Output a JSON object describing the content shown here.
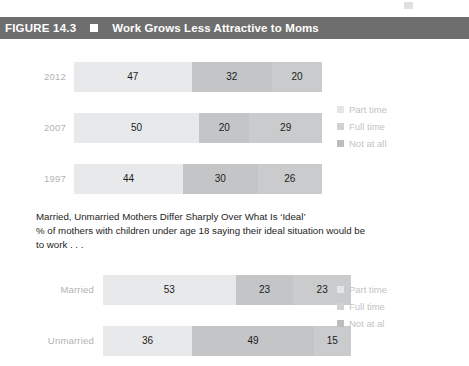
{
  "figure": {
    "number": "FIGURE 14.3",
    "bullet_icon": "square-bullet-icon",
    "title": "Work Grows Less Attractive to Moms"
  },
  "caption": {
    "headline": "Married, Unmarried Mothers Differ Sharply Over What Is ‘Ideal’",
    "subline": "% of mothers with children under age 18 saying their ideal situation would be to work . . ."
  },
  "legend_top": {
    "items": [
      {
        "label": "Part time",
        "swatch": "#e4e5e6"
      },
      {
        "label": "Full time",
        "swatch": "#cfd1d2"
      },
      {
        "label": "Not at all",
        "swatch": "#bbbdbe"
      }
    ]
  },
  "legend_bottom": {
    "items": [
      {
        "label": "Part time",
        "swatch": "#e4e5e6"
      },
      {
        "label": "Full time",
        "swatch": "#cfd1d2"
      },
      {
        "label": "Not at al",
        "swatch": "#bbbdbe"
      }
    ]
  },
  "chart_data": [
    {
      "type": "bar",
      "title": "Work Grows Less Attractive to Moms",
      "xlabel": "",
      "ylabel": "",
      "orientation": "horizontal",
      "stacked": true,
      "grid": false,
      "legend_position": "right",
      "xlim": [
        0,
        100
      ],
      "categories": [
        "2012",
        "2007",
        "1997"
      ],
      "series": [
        {
          "name": "Part time",
          "values": [
            47,
            50,
            44
          ],
          "color": "#e8e9ea"
        },
        {
          "name": "Full time",
          "values": [
            32,
            20,
            30
          ],
          "color": "#c3c5c6"
        },
        {
          "name": "Not at all",
          "values": [
            20,
            29,
            26
          ],
          "color": "#c9cbcc"
        }
      ]
    },
    {
      "type": "bar",
      "title": "Married, Unmarried Mothers Differ Sharply Over What Is ‘Ideal’",
      "xlabel": "",
      "ylabel": "",
      "orientation": "horizontal",
      "stacked": true,
      "grid": false,
      "legend_position": "right",
      "xlim": [
        0,
        100
      ],
      "categories": [
        "Married",
        "Unmarried"
      ],
      "series": [
        {
          "name": "Part time",
          "values": [
            53,
            36
          ],
          "color": "#e8e9ea"
        },
        {
          "name": "Full time",
          "values": [
            23,
            49
          ],
          "color": "#c3c5c6"
        },
        {
          "name": "Not at al",
          "values": [
            23,
            15
          ],
          "color": "#c9cbcc"
        }
      ]
    }
  ]
}
